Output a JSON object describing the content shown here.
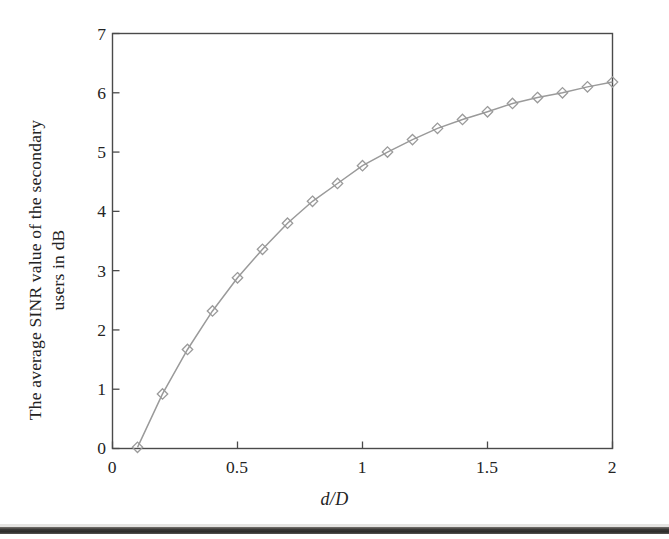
{
  "figure": {
    "background_color": "#ffffff",
    "frame_color": "#4a4a4a",
    "text_color": "#232323"
  },
  "chart_data": {
    "type": "line",
    "title": "",
    "xlabel": "d/D",
    "ylabel": "The average SINR value of the secondary users in dB",
    "ylabel_lines": [
      "The average SINR value of the secondary",
      "users in dB"
    ],
    "xlim": [
      0,
      2
    ],
    "ylim": [
      0,
      7
    ],
    "xticks": [
      0,
      0.5,
      1,
      1.5,
      2
    ],
    "xtick_labels": [
      "0",
      "0.5",
      "1",
      "1.5",
      "2"
    ],
    "yticks": [
      0,
      1,
      2,
      3,
      4,
      5,
      6,
      7
    ],
    "ytick_labels": [
      "0",
      "1",
      "2",
      "3",
      "4",
      "5",
      "6",
      "7"
    ],
    "grid": false,
    "legend": null,
    "series": [
      {
        "name": "average SINR",
        "marker": "diamond",
        "line_color": "#9a9a9a",
        "marker_color": "#9a9a9a",
        "x": [
          0.1,
          0.2,
          0.3,
          0.4,
          0.5,
          0.6,
          0.7,
          0.8,
          0.9,
          1.0,
          1.1,
          1.2,
          1.3,
          1.4,
          1.5,
          1.6,
          1.7,
          1.8,
          1.9,
          2.0
        ],
        "values": [
          0.02,
          0.92,
          1.67,
          2.32,
          2.88,
          3.36,
          3.8,
          4.17,
          4.47,
          4.77,
          5.0,
          5.21,
          5.4,
          5.55,
          5.68,
          5.82,
          5.92,
          6.0,
          6.1,
          6.18
        ]
      }
    ]
  },
  "axis": {
    "x_tick_0": "0",
    "x_tick_1": "0.5",
    "x_tick_2": "1",
    "x_tick_3": "1.5",
    "x_tick_4": "2",
    "y_tick_0": "0",
    "y_tick_1": "1",
    "y_tick_2": "2",
    "y_tick_3": "3",
    "y_tick_4": "4",
    "y_tick_5": "5",
    "y_tick_6": "6",
    "y_tick_7": "7"
  },
  "labels": {
    "xlabel": "d/D",
    "ylabel_line1": "The average SINR value of the secondary",
    "ylabel_line2": "users in dB"
  }
}
